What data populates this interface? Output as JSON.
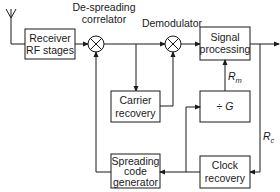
{
  "diagram": {
    "type": "block-diagram",
    "blocks": [
      {
        "id": "receiver",
        "lines": [
          "Receiver",
          "RF stages"
        ]
      },
      {
        "id": "signal_processing",
        "lines": [
          "Signal",
          "processing"
        ]
      },
      {
        "id": "carrier_recovery",
        "lines": [
          "Carrier",
          "recovery"
        ]
      },
      {
        "id": "divider",
        "lines": [
          "÷ G"
        ]
      },
      {
        "id": "spreading_code",
        "lines": [
          "Spreading",
          "code",
          "generator"
        ]
      },
      {
        "id": "clock_recovery",
        "lines": [
          "Clock",
          "recovery"
        ]
      }
    ],
    "mixers": [
      {
        "id": "despreader",
        "label_lines": [
          "De-spreading",
          "correlator"
        ]
      },
      {
        "id": "demodulator",
        "label_lines": [
          "Demodulator"
        ]
      }
    ],
    "signal_labels": {
      "rm": {
        "main": "R",
        "sub": "m"
      },
      "rc": {
        "main": "R",
        "sub": "c"
      }
    },
    "edges": [
      [
        "antenna",
        "receiver"
      ],
      [
        "receiver",
        "despreader"
      ],
      [
        "despreader",
        "demodulator"
      ],
      [
        "despreader",
        "carrier_recovery"
      ],
      [
        "carrier_recovery",
        "demodulator"
      ],
      [
        "demodulator",
        "signal_processing"
      ],
      [
        "signal_processing",
        "output"
      ],
      [
        "output",
        "clock_recovery"
      ],
      [
        "clock_recovery",
        "spreading_code"
      ],
      [
        "clock_recovery",
        "divider"
      ],
      [
        "divider",
        "signal_processing"
      ],
      [
        "spreading_code",
        "despreader"
      ]
    ]
  }
}
